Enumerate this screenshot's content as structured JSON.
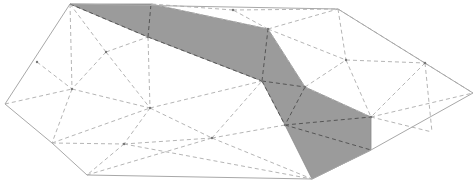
{
  "diagram": {
    "type": "triangulated-polygon",
    "colors": {
      "background": "#ffffff",
      "boundary": "#a8a8a8",
      "shaded_fill": "#9b9b9b",
      "dashed_edge": "#b5b5b5",
      "dashed_edge_in_shade": "#555555"
    },
    "boundary": [
      [
        70,
        4
      ],
      [
        338,
        9
      ],
      [
        473,
        93
      ],
      [
        371,
        150
      ],
      [
        312,
        179
      ],
      [
        87,
        175
      ],
      [
        52,
        143
      ],
      [
        5,
        104
      ]
    ],
    "shaded_region": [
      [
        70,
        4
      ],
      [
        151,
        4
      ],
      [
        268,
        29
      ],
      [
        305,
        87
      ],
      [
        371,
        117
      ],
      [
        371,
        150
      ],
      [
        312,
        179
      ],
      [
        285,
        125
      ],
      [
        262,
        81
      ],
      [
        148,
        37
      ]
    ],
    "inner_vertices": [
      [
        106,
        52
      ],
      [
        148,
        37
      ],
      [
        72,
        89
      ],
      [
        150,
        108
      ],
      [
        124,
        144
      ],
      [
        212,
        138
      ],
      [
        262,
        81
      ],
      [
        305,
        87
      ],
      [
        268,
        29
      ],
      [
        233,
        10
      ],
      [
        346,
        60
      ],
      [
        425,
        63
      ],
      [
        371,
        117
      ],
      [
        285,
        125
      ],
      [
        37,
        62
      ]
    ],
    "edges": [
      [
        [
          70,
          4
        ],
        [
          72,
          89
        ]
      ],
      [
        [
          70,
          4
        ],
        [
          106,
          52
        ]
      ],
      [
        [
          70,
          4
        ],
        [
          148,
          37
        ]
      ],
      [
        [
          106,
          52
        ],
        [
          148,
          37
        ]
      ],
      [
        [
          106,
          52
        ],
        [
          72,
          89
        ]
      ],
      [
        [
          106,
          52
        ],
        [
          150,
          108
        ]
      ],
      [
        [
          148,
          37
        ],
        [
          151,
          4
        ]
      ],
      [
        [
          148,
          37
        ],
        [
          262,
          81
        ]
      ],
      [
        [
          148,
          37
        ],
        [
          150,
          108
        ]
      ],
      [
        [
          37,
          62
        ],
        [
          72,
          89
        ]
      ],
      [
        [
          5,
          104
        ],
        [
          72,
          89
        ]
      ],
      [
        [
          72,
          89
        ],
        [
          150,
          108
        ]
      ],
      [
        [
          72,
          89
        ],
        [
          52,
          143
        ]
      ],
      [
        [
          52,
          143
        ],
        [
          150,
          108
        ]
      ],
      [
        [
          52,
          143
        ],
        [
          124,
          144
        ]
      ],
      [
        [
          150,
          108
        ],
        [
          124,
          144
        ]
      ],
      [
        [
          150,
          108
        ],
        [
          212,
          138
        ]
      ],
      [
        [
          150,
          108
        ],
        [
          262,
          81
        ]
      ],
      [
        [
          124,
          144
        ],
        [
          87,
          175
        ]
      ],
      [
        [
          124,
          144
        ],
        [
          212,
          138
        ]
      ],
      [
        [
          87,
          175
        ],
        [
          212,
          138
        ]
      ],
      [
        [
          212,
          138
        ],
        [
          262,
          81
        ]
      ],
      [
        [
          212,
          138
        ],
        [
          285,
          125
        ]
      ],
      [
        [
          212,
          138
        ],
        [
          312,
          179
        ]
      ],
      [
        [
          124,
          144
        ],
        [
          312,
          179
        ]
      ],
      [
        [
          262,
          81
        ],
        [
          285,
          125
        ]
      ],
      [
        [
          262,
          81
        ],
        [
          305,
          87
        ]
      ],
      [
        [
          262,
          81
        ],
        [
          268,
          29
        ]
      ],
      [
        [
          151,
          4
        ],
        [
          268,
          29
        ]
      ],
      [
        [
          268,
          29
        ],
        [
          233,
          10
        ]
      ],
      [
        [
          233,
          10
        ],
        [
          338,
          9
        ]
      ],
      [
        [
          233,
          10
        ],
        [
          151,
          4
        ]
      ],
      [
        [
          268,
          29
        ],
        [
          338,
          9
        ]
      ],
      [
        [
          268,
          29
        ],
        [
          305,
          87
        ]
      ],
      [
        [
          268,
          29
        ],
        [
          346,
          60
        ]
      ],
      [
        [
          305,
          87
        ],
        [
          346,
          60
        ]
      ],
      [
        [
          305,
          87
        ],
        [
          285,
          125
        ]
      ],
      [
        [
          305,
          87
        ],
        [
          371,
          117
        ]
      ],
      [
        [
          285,
          125
        ],
        [
          371,
          117
        ]
      ],
      [
        [
          285,
          125
        ],
        [
          371,
          150
        ]
      ],
      [
        [
          338,
          9
        ],
        [
          346,
          60
        ]
      ],
      [
        [
          346,
          60
        ],
        [
          425,
          63
        ]
      ],
      [
        [
          346,
          60
        ],
        [
          371,
          117
        ]
      ],
      [
        [
          425,
          63
        ],
        [
          371,
          117
        ]
      ],
      [
        [
          425,
          63
        ],
        [
          473,
          93
        ]
      ],
      [
        [
          425,
          63
        ],
        [
          338,
          9
        ]
      ],
      [
        [
          425,
          63
        ],
        [
          432,
          132
        ]
      ],
      [
        [
          371,
          117
        ],
        [
          432,
          132
        ]
      ],
      [
        [
          371,
          117
        ],
        [
          473,
          93
        ]
      ]
    ]
  }
}
